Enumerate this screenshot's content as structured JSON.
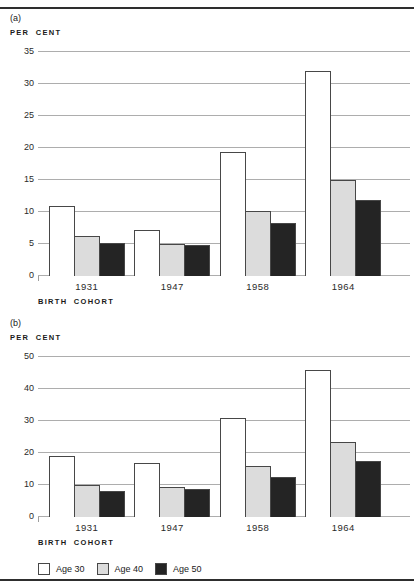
{
  "chart_data": [
    {
      "type": "bar",
      "panel": "(a)",
      "ylabel": "PER CENT",
      "xlabel": "BIRTH COHORT",
      "ylim": [
        0,
        35
      ],
      "ytick_step": 5,
      "grid": true,
      "legend_position": "shared-bottom",
      "categories": [
        "1931",
        "1947",
        "1958",
        "1964"
      ],
      "series": [
        {
          "name": "Age 30",
          "values": [
            11,
            7.2,
            19.3,
            32
          ]
        },
        {
          "name": "Age 40",
          "values": [
            6.2,
            5.0,
            10.2,
            15.0
          ]
        },
        {
          "name": "Age 50",
          "values": [
            5.2,
            4.8,
            8.3,
            11.9
          ]
        }
      ]
    },
    {
      "type": "bar",
      "panel": "(b)",
      "ylabel": "PER CENT",
      "xlabel": "BIRTH COHORT",
      "ylim": [
        0,
        50
      ],
      "ytick_step": 10,
      "grid": true,
      "legend_position": "shared-bottom",
      "categories": [
        "1931",
        "1947",
        "1958",
        "1964"
      ],
      "series": [
        {
          "name": "Age 30",
          "values": [
            19.2,
            17.0,
            31.0,
            46.0
          ]
        },
        {
          "name": "Age 40",
          "values": [
            10.0,
            9.5,
            16.0,
            23.5
          ]
        },
        {
          "name": "Age 50",
          "values": [
            8.2,
            8.8,
            12.5,
            17.5
          ]
        }
      ]
    }
  ],
  "legend": {
    "items": [
      {
        "label": "Age 30",
        "fill": "#ffffff"
      },
      {
        "label": "Age 40",
        "fill": "#dcdcdc"
      },
      {
        "label": "Age 50",
        "fill": "#242424"
      }
    ]
  },
  "colors": {
    "bar_border": "#474747",
    "gridline": "#adadad",
    "rule": "#2e2e2e",
    "text": "#1a1a1a"
  }
}
